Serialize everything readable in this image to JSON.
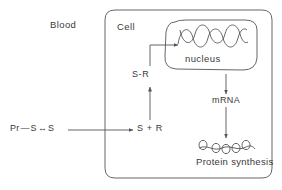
{
  "figure": {
    "compartments": {
      "blood_label": "Blood",
      "cell_label": "Cell",
      "nucleus_label": "nucleus"
    },
    "molecules": {
      "precursor_prefix": "Pr",
      "precursor_subscript": "r",
      "precursor_rest": "S",
      "precursor_tail": "S",
      "precursor_full": "Pr—S↔S",
      "steroid_receptor_complex": "S-R",
      "steroid_plus_receptor": "S + R",
      "mrna": "mRNA",
      "protein_synthesis": "Protein synthesis"
    },
    "colors": {
      "stroke": "#555555",
      "text": "#3a3a3a",
      "background": "#ffffff"
    }
  }
}
